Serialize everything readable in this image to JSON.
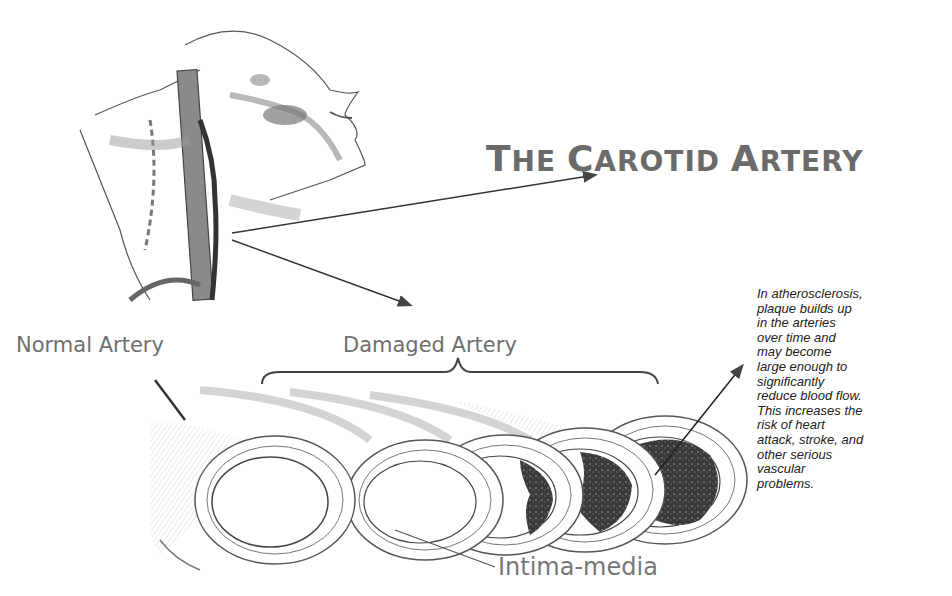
{
  "title": {
    "parts": [
      {
        "text": "T",
        "big": true
      },
      {
        "text": "HE ",
        "big": false
      },
      {
        "text": "C",
        "big": true
      },
      {
        "text": "AROTID ",
        "big": false
      },
      {
        "text": "A",
        "big": true
      },
      {
        "text": "RTERY",
        "big": false
      }
    ],
    "full": "THE CAROTID ARTERY"
  },
  "labels": {
    "normal": "Normal Artery",
    "damaged": "Damaged Artery",
    "intima": "Intima-media"
  },
  "description": {
    "lines": [
      "In atherosclerosis,",
      "plaque builds up",
      "in the arteries",
      "over time and",
      "may become",
      "large enough to",
      "significantly",
      "reduce blood flow.",
      "This increases the",
      "risk of heart",
      "attack, stroke, and",
      "other serious",
      "vascular",
      "problems."
    ]
  },
  "illustration": {
    "head_neck": "anatomical sketch of head and neck showing carotid artery",
    "artery_stages": [
      "normal",
      "mild plaque",
      "moderate plaque",
      "severe plaque",
      "near occlusion"
    ]
  },
  "colors": {
    "title": "#6b6b6b",
    "label": "#6f6f6f",
    "line": "#333333",
    "plaque": "#3a3a3a"
  }
}
